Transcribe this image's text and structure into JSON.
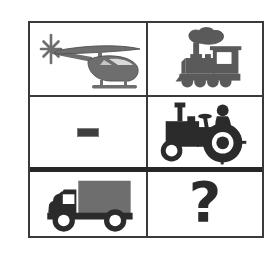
{
  "puzzle": {
    "title": "Visual analogy matrix",
    "type": "picture-analogy-matrix",
    "rows": 3,
    "columns": 2,
    "background_color": "#ffffff",
    "border_color": "#3a3a3a",
    "thick_divider_color": "#262626",
    "figure_fill_dark": "#2b2b2b",
    "figure_fill_gray": "#6e6e6e",
    "cells": [
      {
        "position": "row1-col1",
        "icon": "helicopter-icon",
        "label": "helicopter",
        "fill": "#6e6e6e",
        "facing": "left",
        "state": "given"
      },
      {
        "position": "row1-col2",
        "icon": "steam-train-icon",
        "label": "steam locomotive",
        "fill": "#5a5a5a",
        "facing": "left",
        "state": "given"
      },
      {
        "position": "row2-col1",
        "icon": "dash-mark-icon",
        "label": "dash",
        "fill": "#3f3f3f",
        "facing": "none",
        "state": "given"
      },
      {
        "position": "row2-col2",
        "icon": "tractor-icon",
        "label": "tractor",
        "fill": "#2b2b2b",
        "facing": "right",
        "state": "given"
      },
      {
        "position": "row3-col1",
        "icon": "box-truck-icon",
        "label": "delivery truck",
        "fill": "#2b2b2b",
        "facing": "left",
        "state": "given"
      },
      {
        "position": "row3-col2",
        "icon": "question-mark-icon",
        "label": "?",
        "fill": "#2b2b2b",
        "facing": "none",
        "state": "missing"
      }
    ]
  }
}
